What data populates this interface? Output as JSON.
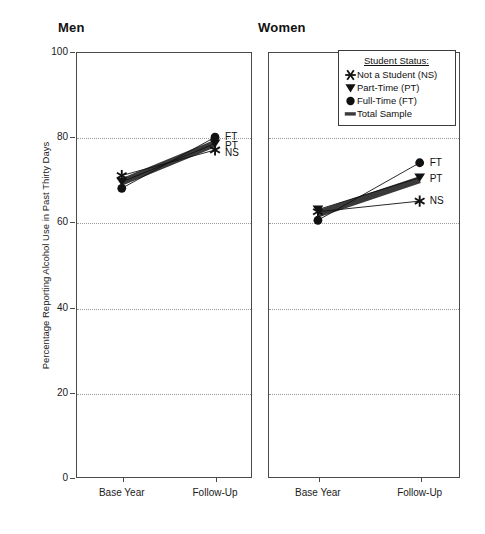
{
  "figure": {
    "ylabel": "Percentage Reporting Alcohol Use in Past Thirty Days",
    "panels": [
      {
        "title": "Men"
      },
      {
        "title": "Women"
      }
    ]
  },
  "legend": {
    "title": "Student Status:",
    "items": [
      {
        "label": "Not a Student (NS)",
        "marker": "star"
      },
      {
        "label": "Part-Time (PT)",
        "marker": "triangle-down"
      },
      {
        "label": "Full-Time (FT)",
        "marker": "circle"
      },
      {
        "label": "Total Sample",
        "marker": "thick-bar"
      }
    ]
  },
  "axis": {
    "yticks": [
      "0",
      "20",
      "40",
      "60",
      "80",
      "100"
    ],
    "xticks": [
      "Base Year",
      "Follow-Up"
    ]
  },
  "endlabels": {
    "men": [
      "FT",
      "PT",
      "NS"
    ],
    "women": [
      "FT",
      "PT",
      "NS"
    ]
  },
  "chart_data": {
    "type": "line",
    "xlabel": "",
    "ylabel": "Percentage Reporting Alcohol Use in Past Thirty Days",
    "x": [
      "Base Year",
      "Follow-Up"
    ],
    "ylim": [
      0,
      100
    ],
    "yticks": [
      0,
      20,
      40,
      60,
      80,
      100
    ],
    "grid": true,
    "legend_position": "top-right-of-women-panel",
    "panels": [
      {
        "title": "Men",
        "series": [
          {
            "name": "Not a Student (NS)",
            "marker": "star",
            "values": [
              71,
              77
            ]
          },
          {
            "name": "Part-Time (PT)",
            "marker": "triangle-down",
            "values": [
              69.5,
              78.5
            ]
          },
          {
            "name": "Full-Time (FT)",
            "marker": "circle",
            "values": [
              68,
              80
            ]
          },
          {
            "name": "Total Sample",
            "marker": "thick-bar",
            "values": [
              69.5,
              78.5
            ]
          }
        ]
      },
      {
        "title": "Women",
        "series": [
          {
            "name": "Not a Student (NS)",
            "marker": "star",
            "values": [
              62.5,
              65
            ]
          },
          {
            "name": "Part-Time (PT)",
            "marker": "triangle-down",
            "values": [
              63,
              70.5
            ]
          },
          {
            "name": "Full-Time (FT)",
            "marker": "circle",
            "values": [
              60.5,
              74
            ]
          },
          {
            "name": "Total Sample",
            "marker": "thick-bar",
            "values": [
              62,
              70
            ]
          }
        ]
      }
    ]
  },
  "colors": {
    "axis": "#4a4a4a",
    "grid": "#9a9a9a",
    "marker": "#111111",
    "total_band": "#3a3a3a",
    "background": "#ffffff"
  }
}
